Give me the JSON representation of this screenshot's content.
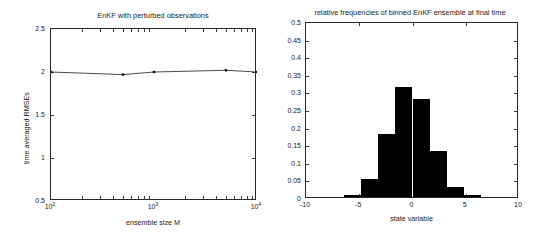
{
  "figure": {
    "width": 540,
    "height": 237,
    "background": "#ffffff",
    "line_color": "#3c3c3c",
    "bar_color": "#000000",
    "axis_color": "#262626"
  },
  "chart_data": [
    {
      "type": "line",
      "panel": "left",
      "title": "EnKF with perturbed observations",
      "xlabel": "ensemble size M",
      "ylabel": "time averaged RMSEs",
      "xscale": "log",
      "xlim": [
        100,
        10000
      ],
      "ylim": [
        0.5,
        2.5
      ],
      "grid": false,
      "ytick_labels": [
        "0.5",
        "1",
        "1.5",
        "2",
        "2.5"
      ],
      "ytick_values": [
        0.5,
        1,
        1.5,
        2,
        2.5
      ],
      "xtick_labels": [
        "10^2",
        "10^3",
        "10^4"
      ],
      "xtick_values": [
        100,
        1000,
        10000
      ],
      "xtick_mantissa": [
        "10",
        "10",
        "10"
      ],
      "xtick_exponent": [
        "2",
        "3",
        "4"
      ],
      "marker": "square",
      "x": [
        100,
        500,
        1000,
        5000,
        10000
      ],
      "values": [
        2.0,
        1.97,
        2.0,
        2.02,
        2.0
      ],
      "series_name": "time averaged RMSE"
    },
    {
      "type": "bar",
      "panel": "right",
      "title": "relative frequencies of binned EnKF ensemble at final time",
      "xlabel": "state variable",
      "ylabel": "",
      "xlim": [
        -10,
        10
      ],
      "ylim": [
        0,
        0.5
      ],
      "grid": false,
      "ytick_labels": [
        "0",
        "0.05",
        "0.1",
        "0.15",
        "0.2",
        "0.25",
        "0.3",
        "0.35",
        "0.4",
        "0.45",
        "0.5"
      ],
      "ytick_values": [
        0,
        0.05,
        0.1,
        0.15,
        0.2,
        0.25,
        0.3,
        0.35,
        0.4,
        0.45,
        0.5
      ],
      "xtick_labels": [
        "-10",
        "-5",
        "0",
        "5",
        "10"
      ],
      "xtick_values": [
        -10,
        -5,
        0,
        5,
        10
      ],
      "bin_edges": [
        -6.4,
        -4.8,
        -3.2,
        -1.6,
        0.0,
        1.6,
        3.2,
        4.8,
        6.4
      ],
      "bin_centers": [
        -5.6,
        -4.0,
        -2.4,
        -0.8,
        0.8,
        2.4,
        4.0,
        5.6
      ],
      "values": [
        0.007,
        0.052,
        0.18,
        0.313,
        0.278,
        0.131,
        0.028,
        0.005
      ],
      "series_name": "relative frequency"
    }
  ]
}
